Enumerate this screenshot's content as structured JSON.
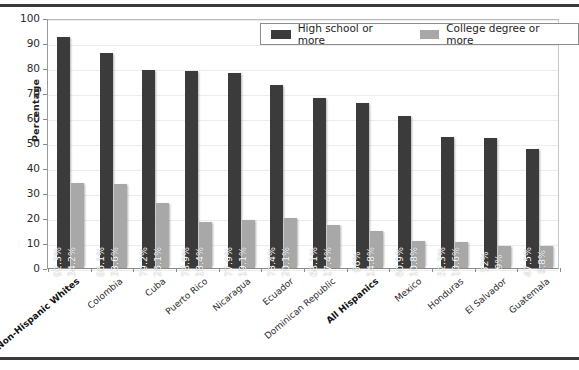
{
  "chart_data": {
    "type": "bar",
    "title": "",
    "xlabel": "",
    "ylabel": "Percentage",
    "ylim": [
      0,
      100
    ],
    "ytick_step": 10,
    "yticks": [
      100,
      90,
      80,
      70,
      60,
      50,
      40,
      30,
      20,
      10,
      0
    ],
    "grid": true,
    "legend_position": "top-right",
    "categories": [
      "Non-Hispanic Whites",
      "Colombia",
      "Cuba",
      "Puerto Rico",
      "Nicaragua",
      "Ecuador",
      "Dominican Republic",
      "All Hispanics",
      "Mexico",
      "Honduras",
      "El Salvador",
      "Guatemala"
    ],
    "category_emphasis": [
      true,
      false,
      false,
      false,
      false,
      false,
      false,
      true,
      false,
      false,
      false,
      false
    ],
    "series": [
      {
        "name": "High school or more",
        "color": "#3b3b3b",
        "values": [
          92.3,
          86.1,
          79.2,
          78.9,
          77.9,
          73.4,
          68.1,
          66,
          60.9,
          52.3,
          52,
          47.5
        ],
        "labels": [
          "92.3%",
          "86.1%",
          "79.2%",
          "78.9%",
          "77.9%",
          "73.4%",
          "68.1%",
          "66%",
          "60.9%",
          "52.3%",
          "52%",
          "47.5%"
        ]
      },
      {
        "name": "College degree or more",
        "color": "#a8a8a8",
        "values": [
          34.2,
          33.6,
          26.1,
          18.4,
          19.1,
          20.1,
          17.4,
          14.8,
          10.8,
          10.6,
          9,
          8.8
        ],
        "labels": [
          "34.2%",
          "33.6%",
          "26.1%",
          "18.4%",
          "19.1%",
          "20.1%",
          "17.4%",
          "14.8%",
          "10.8%",
          "10.6%",
          "9%",
          "8.8%"
        ]
      }
    ]
  }
}
